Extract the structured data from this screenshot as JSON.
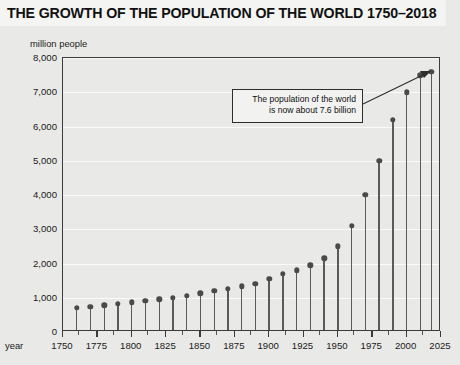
{
  "title": "THE GROWTH OF THE POPULATION OF THE WORLD 1750–2018",
  "y_unit_label": "million people",
  "x_axis_caption": "year",
  "annotation": {
    "line1": "The population of the world",
    "line2": "is now about 7.6 billion"
  },
  "colors": {
    "page_background": "#e9e9e7",
    "title_background": "#f4f4f2",
    "frame": "#3b3b3b",
    "gridline": "#fafaf8",
    "stem": "#5a5a5a",
    "dot": "#4a4a4a",
    "annotation_border": "#2e2e2e",
    "text": "#1a1a1a"
  },
  "chart_data": {
    "type": "bar",
    "title": "THE GROWTH OF THE POPULATION OF THE WORLD 1750–2018",
    "subtitle": "",
    "xlabel": "year",
    "ylabel": "million people",
    "xlim": [
      1750,
      2025
    ],
    "ylim": [
      0,
      8000
    ],
    "grid": true,
    "legend": false,
    "y_ticks": [
      0,
      1000,
      2000,
      3000,
      4000,
      5000,
      6000,
      7000,
      8000
    ],
    "y_tick_labels": [
      "0",
      "1,000",
      "2,000",
      "3,000",
      "4,000",
      "5,000",
      "6,000",
      "7,000",
      "8,000"
    ],
    "x_ticks": [
      1750,
      1775,
      1800,
      1825,
      1850,
      1875,
      1900,
      1925,
      1950,
      1975,
      2000,
      2025
    ],
    "x_tick_labels": [
      "1750",
      "1775",
      "1800",
      "1825",
      "1850",
      "1875",
      "1900",
      "1925",
      "1950",
      "1975",
      "2000",
      "2025"
    ],
    "x_minor_ticks": [
      1762,
      1787,
      1812,
      1837,
      1862,
      1887,
      1912,
      1937,
      1962,
      1987,
      2012
    ],
    "x": [
      1760,
      1770,
      1780,
      1790,
      1800,
      1810,
      1820,
      1830,
      1840,
      1850,
      1860,
      1870,
      1880,
      1890,
      1900,
      1910,
      1920,
      1930,
      1940,
      1950,
      1960,
      1970,
      1980,
      1990,
      2000,
      2010,
      2018
    ],
    "values": [
      700,
      740,
      780,
      820,
      870,
      910,
      960,
      1000,
      1060,
      1130,
      1200,
      1260,
      1330,
      1400,
      1560,
      1700,
      1800,
      1950,
      2150,
      2500,
      3100,
      4000,
      5000,
      6200,
      7000,
      7500,
      7600
    ],
    "categories": [
      "1760",
      "1770",
      "1780",
      "1790",
      "1800",
      "1810",
      "1820",
      "1830",
      "1840",
      "1850",
      "1860",
      "1870",
      "1880",
      "1890",
      "1900",
      "1910",
      "1920",
      "1930",
      "1940",
      "1950",
      "1960",
      "1970",
      "1980",
      "1990",
      "2000",
      "2010",
      "2018"
    ],
    "annotations": [
      {
        "text": "The population of the world is now about 7.6 billion",
        "points_to_x": 2018,
        "points_to_y": 7600
      }
    ]
  }
}
